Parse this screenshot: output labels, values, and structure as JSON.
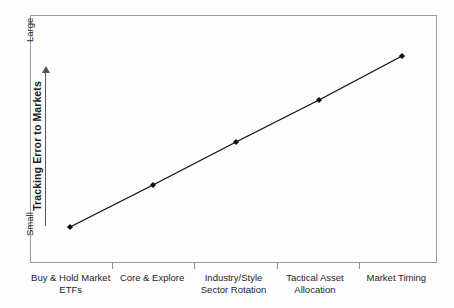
{
  "chart_data": {
    "type": "line",
    "title": "",
    "subtitle": "",
    "xlabel": "",
    "ylabel": "Tracking Error to Markets",
    "categories": [
      "Buy & Hold Market ETFs",
      "Core & Explore",
      "Industry/Style Sector Rotation",
      "Tactical Asset Allocation",
      "Market Timing"
    ],
    "category_lines": [
      [
        "Buy & Hold Market",
        "ETFs"
      ],
      [
        "Core & Explore",
        ""
      ],
      [
        "Industry/Style",
        "Sector Rotation"
      ],
      [
        "Tactical Asset",
        "Allocation"
      ],
      [
        "Market Timing",
        ""
      ]
    ],
    "series": [
      {
        "name": "Tracking Error",
        "values": [
          1,
          2,
          3,
          4,
          5
        ]
      }
    ],
    "ylim": [
      0,
      6
    ],
    "ytick_labels": [
      "Small",
      "Large"
    ],
    "y_axis_direction_label_low": "Small",
    "y_axis_direction_label_high": "Large",
    "grid": false,
    "legend": "none",
    "marker": "diamond",
    "line_color": "#111111",
    "marker_color": "#111111",
    "plot_border_color": "#9a9a9a",
    "background_color": "#fdfdfd",
    "points_px": [
      {
        "x": 70,
        "y": 227
      },
      {
        "x": 153,
        "y": 185
      },
      {
        "x": 236,
        "y": 142
      },
      {
        "x": 319,
        "y": 100
      },
      {
        "x": 402,
        "y": 56
      }
    ],
    "tick_positions_px": [
      112,
      194,
      277,
      359
    ]
  }
}
